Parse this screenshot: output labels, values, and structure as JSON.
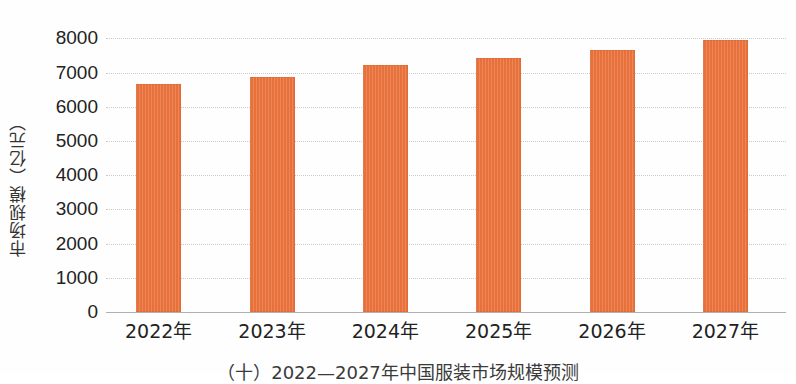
{
  "chart_data": {
    "type": "bar",
    "title": "",
    "subtitle": "",
    "xlabel": "",
    "ylabel": "市场规模（亿元）",
    "categories": [
      "2022年",
      "2023年",
      "2024年",
      "2025年",
      "2026年",
      "2027年"
    ],
    "values": [
      6250,
      6430,
      6770,
      6950,
      7180,
      7440
    ],
    "series": [
      {
        "name": "市场规模",
        "values": [
          6250,
          6430,
          6770,
          6950,
          7180,
          7440
        ],
        "color": "#e8703a"
      }
    ],
    "ylim": [
      0,
      8000
    ],
    "yticks": [
      0,
      1000,
      2000,
      3000,
      4000,
      5000,
      6000,
      7000,
      8000
    ],
    "ytick_labels": [
      "0",
      "1000",
      "2000",
      "3000",
      "4000",
      "5000",
      "6000",
      "7000",
      "8000"
    ],
    "grid": true,
    "grid_axis": "y",
    "grid_style": "dotted",
    "legend": false,
    "legend_position": "none",
    "bar_color": "#e8703a",
    "background_color": "#fefefe",
    "axis_color": "#b0b0b0",
    "caption": "（十）2022—2027年中国服装市场规模预测"
  },
  "figure": {
    "y_axis_title": "市场规模（亿元）",
    "caption": "（十）2022—2027年中国服装市场规模预测"
  }
}
